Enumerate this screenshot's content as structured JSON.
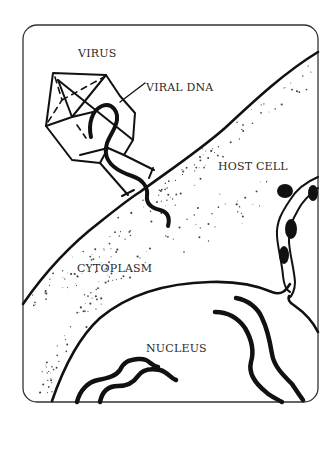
{
  "figure": {
    "type": "labeled-illustration"
  },
  "labels": {
    "virus": "VIRUS",
    "viral_dna": "VIRAL DNA",
    "host_cell": "HOST CELL",
    "cytoplasm": "CYTOPLASM",
    "nucleus": "NUCLEUS"
  },
  "colors": {
    "ink": "#111111",
    "text": "#2a2a2a",
    "background": "#ffffff"
  }
}
